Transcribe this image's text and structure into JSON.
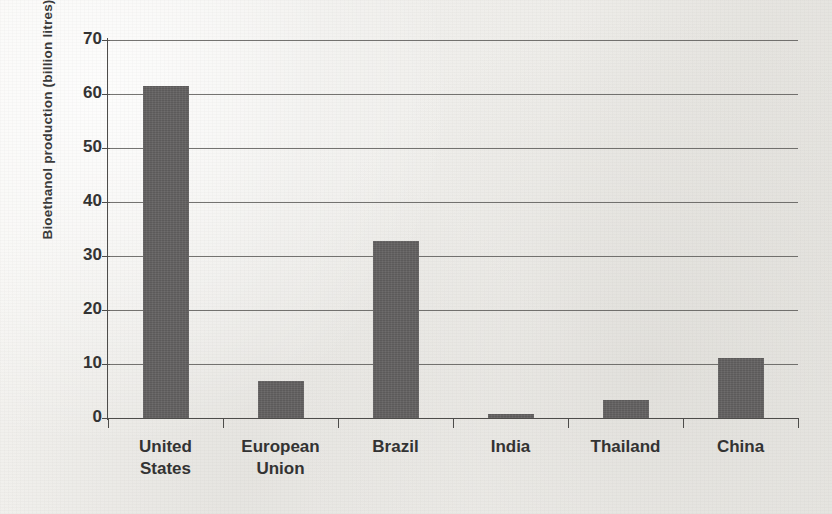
{
  "chart_data": {
    "type": "bar",
    "title": "",
    "xlabel": "",
    "ylabel": "Bioethanol production (billion litres)",
    "categories": [
      "United States",
      "European Union",
      "Brazil",
      "India",
      "Thailand",
      "China"
    ],
    "category_lines": [
      [
        "United",
        "States"
      ],
      [
        "European",
        "Union"
      ],
      [
        "Brazil",
        ""
      ],
      [
        "India",
        ""
      ],
      [
        "Thailand",
        ""
      ],
      [
        "China",
        ""
      ]
    ],
    "values": [
      61.5,
      6.9,
      32.8,
      0.7,
      3.4,
      11.2
    ],
    "ylim": [
      0,
      70
    ],
    "ytick_labels": [
      "0",
      "10",
      "20",
      "30",
      "40",
      "50",
      "60",
      "70"
    ],
    "ytick_values": [
      0,
      10,
      20,
      30,
      40,
      50,
      60,
      70
    ],
    "grid": "horizontal",
    "legend": "none",
    "bar_color": "#615f5f",
    "background_color": "#f1f0ed",
    "axis_color": "#4d4c4a",
    "gridline_color": "#5d5c59"
  }
}
